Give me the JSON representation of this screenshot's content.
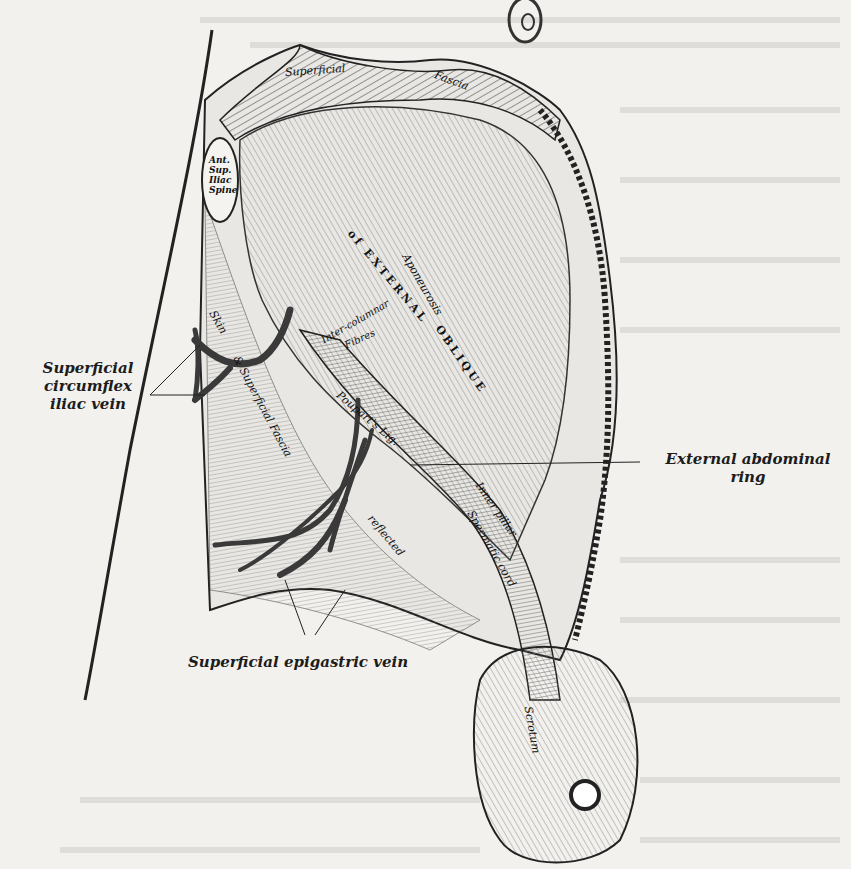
{
  "figure": {
    "labels": {
      "superficial_circumflex_iliac_vein": [
        "Superficial",
        "circumflex",
        "iliac vein"
      ],
      "external_abdominal_ring": [
        "External abdominal",
        "ring"
      ],
      "superficial_epigastric_vein": "Superficial epigastric vein"
    },
    "inner_labels": {
      "superficial_fascia_1": "Superficial",
      "superficial_fascia_2": "Fascia",
      "ant_sup_iliac_spine": [
        "Ant.",
        "Sup.",
        "Iliac",
        "Spine"
      ],
      "aponeurosis": "Aponeurosis",
      "of_external_oblique_1": "of EXTERNAL",
      "of_external_oblique_2": "OBLIQUE",
      "intercolumnar_fibres_1": "Inter-columnar",
      "intercolumnar_fibres_2": "Fibres",
      "pouparts_ligament": "Poupart's Lig.",
      "inner_pillar": "Inner pillar",
      "spermatic_cord": "Spermatic cord",
      "skin": "Skin",
      "superficial_fascia_thigh": "& Superficial Fascia",
      "reflected": "reflected",
      "scrotum": "Scrotum"
    },
    "colors": {
      "paper": "#f2f1ee",
      "ink": "#1c1c1c",
      "vein": "#3a3a3a"
    }
  }
}
